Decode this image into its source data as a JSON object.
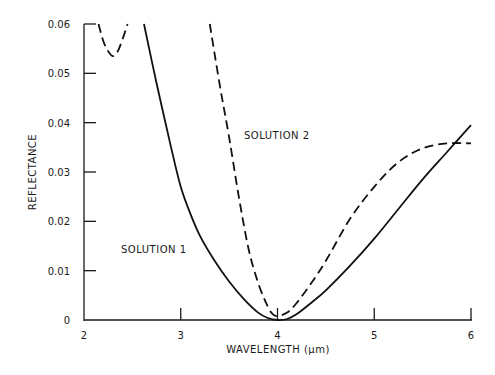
{
  "chart_data": {
    "type": "line",
    "title": "",
    "xlabel": "WAVELENGTH (μm)",
    "ylabel": "REFLECTANCE",
    "xlim": [
      2,
      6
    ],
    "ylim": [
      0,
      0.06
    ],
    "x_ticks": [
      "2",
      "3",
      "4",
      "5",
      "6"
    ],
    "y_ticks": [
      "0",
      "0.01",
      "0.02",
      "0.03",
      "0.04",
      "0.05",
      "0.06"
    ],
    "grid": false,
    "legend": "none (curves annotated inline)",
    "annotations": [
      {
        "text": "SOLUTION 1",
        "x": 2.38,
        "y": 0.0145
      },
      {
        "text": "SOLUTION 2",
        "x": 3.65,
        "y": 0.037
      }
    ],
    "series": [
      {
        "name": "SOLUTION 1",
        "style": "solid",
        "x": [
          2.62,
          2.75,
          2.9,
          3.0,
          3.1,
          3.2,
          3.35,
          3.5,
          3.65,
          3.8,
          3.9,
          4.0,
          4.1,
          4.2,
          4.35,
          4.5,
          4.75,
          5.0,
          5.25,
          5.5,
          5.75,
          6.0
        ],
        "y": [
          0.06,
          0.048,
          0.035,
          0.027,
          0.0215,
          0.017,
          0.012,
          0.0078,
          0.0043,
          0.0015,
          0.0004,
          0.0,
          0.0002,
          0.0012,
          0.0035,
          0.006,
          0.011,
          0.0165,
          0.0225,
          0.0285,
          0.034,
          0.0395
        ]
      },
      {
        "name": "SOLUTION 2 (left segment)",
        "style": "dashed",
        "x": [
          2.15,
          2.2,
          2.25,
          2.3,
          2.35,
          2.4,
          2.45
        ],
        "y": [
          0.06,
          0.0565,
          0.0545,
          0.0535,
          0.0545,
          0.057,
          0.06
        ]
      },
      {
        "name": "SOLUTION 2",
        "style": "dashed",
        "x": [
          3.3,
          3.4,
          3.5,
          3.6,
          3.7,
          3.8,
          3.9,
          3.95,
          4.0,
          4.1,
          4.2,
          4.35,
          4.5,
          4.75,
          5.0,
          5.25,
          5.5,
          5.75,
          6.0
        ],
        "y": [
          0.06,
          0.048,
          0.037,
          0.025,
          0.0145,
          0.0075,
          0.0027,
          0.0012,
          0.0008,
          0.0015,
          0.0035,
          0.0075,
          0.012,
          0.0205,
          0.027,
          0.032,
          0.0348,
          0.0358,
          0.0358
        ]
      }
    ]
  }
}
